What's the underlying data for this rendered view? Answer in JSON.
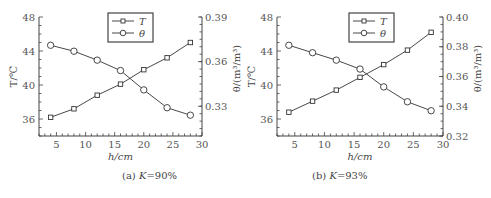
{
  "chart_data": [
    {
      "id": "a",
      "type": "line",
      "caption_prefix": "(a) ",
      "caption_var": "K",
      "caption_value": "=90%",
      "xlabel": "h/cm",
      "ylabel_left": "T/℃",
      "ylabel_right": "θ/(m³/m³)",
      "xlim": [
        2,
        30
      ],
      "xticks": [
        5,
        10,
        15,
        20,
        25,
        30
      ],
      "ylim_left": [
        34,
        48
      ],
      "yticks_left": [
        36,
        40,
        44,
        48
      ],
      "ylim_right": [
        0.31,
        0.39
      ],
      "yticks_right": [
        0.33,
        0.36,
        0.39
      ],
      "yticks_right_labels": [
        "0.33",
        "0.36",
        "0.39"
      ],
      "grid": false,
      "legend_position": "top-center",
      "x": [
        4,
        8,
        12,
        16,
        20,
        24,
        28
      ],
      "series": [
        {
          "name": "T",
          "axis": "left",
          "marker": "square",
          "values": [
            36.2,
            37.2,
            38.8,
            40.1,
            41.8,
            43.2,
            45.0
          ]
        },
        {
          "name": "θ",
          "axis": "right",
          "marker": "circle",
          "values": [
            0.371,
            0.367,
            0.361,
            0.354,
            0.341,
            0.329,
            0.324
          ]
        }
      ]
    },
    {
      "id": "b",
      "type": "line",
      "caption_prefix": "(b) ",
      "caption_var": "K",
      "caption_value": "=93%",
      "xlabel": "h/cm",
      "ylabel_left": "T/℃",
      "ylabel_right": "θ/(m³/m³)",
      "xlim": [
        2,
        30
      ],
      "xticks": [
        5,
        10,
        15,
        20,
        25,
        30
      ],
      "ylim_left": [
        34,
        48
      ],
      "yticks_left": [
        36,
        40,
        44,
        48
      ],
      "ylim_right": [
        0.32,
        0.4
      ],
      "yticks_right": [
        0.32,
        0.34,
        0.36,
        0.38,
        0.4
      ],
      "yticks_right_labels": [
        "0.32",
        "0.34",
        "0.36",
        "0.38",
        "0.40"
      ],
      "grid": false,
      "legend_position": "top-center",
      "x": [
        4,
        8,
        12,
        16,
        20,
        24,
        28
      ],
      "series": [
        {
          "name": "T",
          "axis": "left",
          "marker": "square",
          "values": [
            36.8,
            38.1,
            39.4,
            40.9,
            42.4,
            44.1,
            46.2
          ]
        },
        {
          "name": "θ",
          "axis": "right",
          "marker": "circle",
          "values": [
            0.381,
            0.376,
            0.371,
            0.365,
            0.353,
            0.343,
            0.337
          ]
        }
      ]
    }
  ],
  "colors": {
    "line": "#333333",
    "axis": "#444444",
    "text": "#444444"
  }
}
